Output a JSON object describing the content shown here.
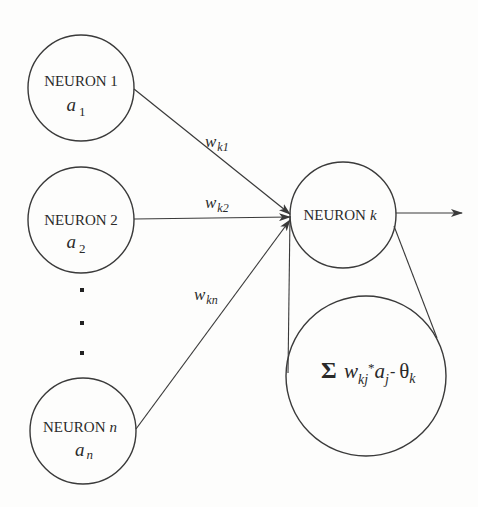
{
  "diagram": {
    "title": "",
    "style": {
      "background": "#fdfdfc",
      "stroke": "#3a3a3a",
      "text": "#2a2a2a"
    },
    "input_neurons": [
      {
        "id": "neuron-1",
        "label": "NEURON 1",
        "activation": "a",
        "activation_sub": "1",
        "cx": 81,
        "cy": 88,
        "r": 53
      },
      {
        "id": "neuron-2",
        "label": "NEURON 2",
        "activation": "a",
        "activation_sub": "2",
        "cx": 81,
        "cy": 220,
        "r": 53
      },
      {
        "id": "neuron-n",
        "label": "NEURON",
        "label_var": "n",
        "activation": "a",
        "activation_sub": "n",
        "cx": 83,
        "cy": 431,
        "r": 53
      }
    ],
    "ellipsis_dots": [
      {
        "x": 82,
        "y": 290
      },
      {
        "x": 82,
        "y": 323
      },
      {
        "x": 82,
        "y": 353
      }
    ],
    "target_neuron": {
      "id": "neuron-k",
      "label": "NEURON",
      "label_var": "k",
      "cx": 343,
      "cy": 215,
      "r": 53
    },
    "weights": [
      {
        "from": "neuron-1",
        "to": "neuron-k",
        "label": "w",
        "sub": "k1"
      },
      {
        "from": "neuron-2",
        "to": "neuron-k",
        "label": "w",
        "sub": "k2"
      },
      {
        "from": "neuron-n",
        "to": "neuron-k",
        "label": "w",
        "sub": "kn"
      }
    ],
    "output_arrow": {
      "from": "neuron-k",
      "direction": "right"
    },
    "detail_circle": {
      "id": "summation-detail",
      "cx": 366,
      "cy": 376,
      "r": 80,
      "formula": {
        "sigma": "Σ",
        "w": "w",
        "w_sub": "kj",
        "star": "*",
        "a": "a",
        "a_sub": "j",
        "minus": "-",
        "theta": "θ",
        "theta_sub": "k"
      }
    }
  }
}
